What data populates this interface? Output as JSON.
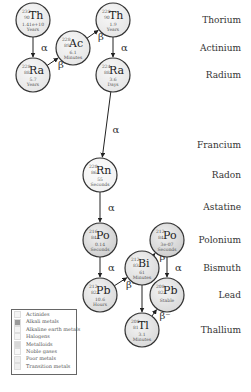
{
  "rows": [
    {
      "label": "Thorium",
      "y": 20
    },
    {
      "label": "Actinium",
      "y": 48
    },
    {
      "label": "Radium",
      "y": 75
    },
    {
      "label": "Francium",
      "y": 145
    },
    {
      "label": "Radon",
      "y": 175
    },
    {
      "label": "Astatine",
      "y": 207
    },
    {
      "label": "Polonium",
      "y": 240
    },
    {
      "label": "Bismuth",
      "y": 268
    },
    {
      "label": "Lead",
      "y": 295
    },
    {
      "label": "Thallium",
      "y": 330
    }
  ],
  "nuclides": [
    {
      "id": "th232",
      "mass": "232",
      "z": "90",
      "symbol": "Th",
      "half_life": "1.41e+10",
      "unit": "Years",
      "x": 33,
      "y": 20,
      "fill": "#e6e6e6"
    },
    {
      "id": "ra228",
      "mass": "228",
      "z": "88",
      "symbol": "Ra",
      "half_life": "5.7",
      "unit": "Years",
      "x": 33,
      "y": 75,
      "fill": "#e6e6e6"
    },
    {
      "id": "ac228",
      "mass": "228",
      "z": "89",
      "symbol": "Ac",
      "half_life": "6.1",
      "unit": "Minutes",
      "x": 73,
      "y": 48,
      "fill": "#e6e6e6"
    },
    {
      "id": "th228",
      "mass": "228",
      "z": "90",
      "symbol": "Th",
      "half_life": "1.9",
      "unit": "Years",
      "x": 113,
      "y": 20,
      "fill": "#e6e6e6"
    },
    {
      "id": "ra224",
      "mass": "224",
      "z": "88",
      "symbol": "Ra",
      "half_life": "3.6",
      "unit": "Days",
      "x": 113,
      "y": 75,
      "fill": "#e6e6e6"
    },
    {
      "id": "rn220",
      "mass": "220",
      "z": "86",
      "symbol": "Rn",
      "half_life": "55",
      "unit": "Seconds",
      "x": 100,
      "y": 175,
      "fill": "#f2f2f2"
    },
    {
      "id": "po216",
      "mass": "216",
      "z": "84",
      "symbol": "Po",
      "half_life": "0.14",
      "unit": "Seconds",
      "x": 100,
      "y": 240,
      "fill": "#cfcfcf"
    },
    {
      "id": "pb212",
      "mass": "212",
      "z": "82",
      "symbol": "Pb",
      "half_life": "10.6",
      "unit": "Hours",
      "x": 100,
      "y": 295,
      "fill": "#dadada"
    },
    {
      "id": "bi212",
      "mass": "212",
      "z": "83",
      "symbol": "Bi",
      "half_life": "61",
      "unit": "Minutes",
      "x": 142,
      "y": 268,
      "fill": "#dadada"
    },
    {
      "id": "po212",
      "mass": "212",
      "z": "84",
      "symbol": "Po",
      "half_life": "3e-07",
      "unit": "Seconds",
      "x": 167,
      "y": 240,
      "fill": "#cfcfcf"
    },
    {
      "id": "pb208",
      "mass": "208",
      "z": "82",
      "symbol": "Pb",
      "half_life": "",
      "unit": "Stable",
      "x": 167,
      "y": 295,
      "fill": "#dadada"
    },
    {
      "id": "tl208",
      "mass": "208",
      "z": "81",
      "symbol": "Tl",
      "half_life": "3.1",
      "unit": "Minutes",
      "x": 142,
      "y": 330,
      "fill": "#dadada"
    }
  ],
  "decays": [
    {
      "from": "th232",
      "to": "ra228",
      "mode": "α"
    },
    {
      "from": "ra228",
      "to": "ac228",
      "mode": "β⁻"
    },
    {
      "from": "ac228",
      "to": "th228",
      "mode": "β⁻"
    },
    {
      "from": "th228",
      "to": "ra224",
      "mode": "α"
    },
    {
      "from": "ra224",
      "to": "rn220",
      "mode": "α"
    },
    {
      "from": "rn220",
      "to": "po216",
      "mode": "α"
    },
    {
      "from": "po216",
      "to": "pb212",
      "mode": "α"
    },
    {
      "from": "pb212",
      "to": "bi212",
      "mode": "β⁻"
    },
    {
      "from": "bi212",
      "to": "po212",
      "mode": "β⁻"
    },
    {
      "from": "bi212",
      "to": "tl208",
      "mode": "α"
    },
    {
      "from": "po212",
      "to": "pb208",
      "mode": "α"
    },
    {
      "from": "tl208",
      "to": "pb208",
      "mode": "β⁻"
    }
  ],
  "legend": {
    "items": [
      {
        "label": "Actinides",
        "color": "#f4f4f4"
      },
      {
        "label": "Alkali metals",
        "color": "#9a9a9a"
      },
      {
        "label": "Alkaline earth metals",
        "color": "#f4f4f4"
      },
      {
        "label": "Halogens",
        "color": "#f4f4f4"
      },
      {
        "label": "Metalloids",
        "color": "#d8d8d8"
      },
      {
        "label": "Noble gases",
        "color": "#f8f8f8"
      },
      {
        "label": "Poor metals",
        "color": "#eeeeee"
      },
      {
        "label": "Transition metals",
        "color": "#eeeeee"
      }
    ]
  }
}
